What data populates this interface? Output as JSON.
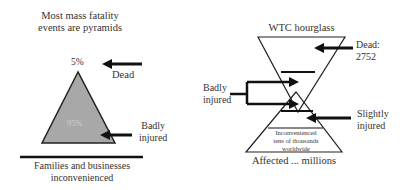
{
  "left_diagram": {
    "title_line1": "Most mass fatality",
    "title_line2": "events are pyramids",
    "top_percent": "5%",
    "body_percent": "95%",
    "dead_label": "Dead",
    "badly_injured_line1": "Badly",
    "badly_injured_line2": "injured",
    "base_line1": "Families and businesses",
    "base_line2": "inconvenienced",
    "fill_color": "#a8a8a8"
  },
  "right_diagram": {
    "title": "WTC hourglass",
    "dead_line1": "Dead:",
    "dead_line2": "2752",
    "badly_injured_line1": "Badly",
    "badly_injured_line2": "injured",
    "slightly_injured_line1": "Slightly",
    "slightly_injured_line2": "injured",
    "inner_line1": "Inconvenienced",
    "inner_line2": "tens of thousands",
    "inner_line3": "worldwide",
    "base_label": "Affected ... millions"
  }
}
